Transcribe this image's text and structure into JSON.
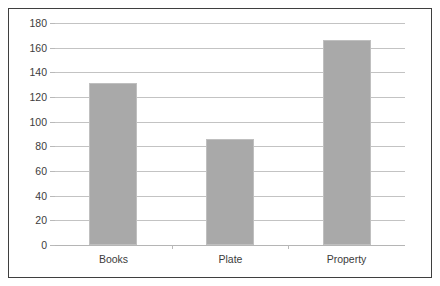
{
  "chart_data": {
    "type": "bar",
    "title": "",
    "subtitle": "",
    "xlabel": "",
    "ylabel": "",
    "categories": [
      "Books",
      "Plate",
      "Property"
    ],
    "values": [
      131,
      86,
      166
    ],
    "series": [
      {
        "name": "",
        "values": [
          131,
          86,
          166
        ]
      }
    ],
    "ylim": [
      0,
      180
    ],
    "ytick_step": 20,
    "yticks": [
      0,
      20,
      40,
      60,
      80,
      100,
      120,
      140,
      160,
      180
    ],
    "ytick_labels": [
      "0",
      "20",
      "40",
      "60",
      "80",
      "100",
      "120",
      "140",
      "160",
      "180"
    ],
    "grid": true,
    "grid_axis": "y",
    "legend": false,
    "legend_position": "none",
    "annotations": [],
    "colors": {
      "bar_fill": "#a9a9a9",
      "bar_border": "#bfbfbf",
      "gridline": "#c3c3c3",
      "axis_line": "#b9b9b9",
      "frame_border": "#3f3f3f",
      "tick_text": "#3c3c3c",
      "plot_background": "#ffffff",
      "figure_background": "#ffffff"
    }
  }
}
